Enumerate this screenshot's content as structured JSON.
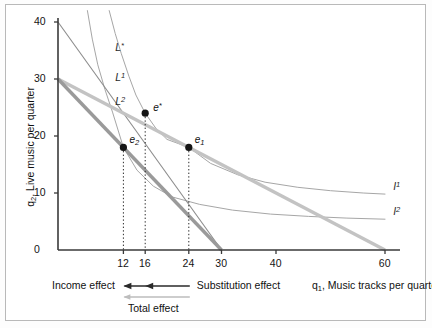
{
  "chart_data": {
    "type": "line",
    "title": "",
    "xlabel": "q₁, Music tracks per quarter",
    "ylabel": "q₂, Live music per quarter",
    "xlabel_main": "q",
    "xlabel_sub": "1",
    "xlabel_rest": ", Music tracks per quarter",
    "ylabel_main": "q",
    "ylabel_sub": "2",
    "ylabel_rest": ", Live music per quarter",
    "xlim": [
      0,
      64
    ],
    "ylim": [
      0,
      42
    ],
    "xticks": [
      12,
      16,
      24,
      30,
      40,
      60
    ],
    "xtick_labels": [
      "12",
      "16",
      "24",
      "30",
      "40",
      "60"
    ],
    "yticks": [
      0,
      10,
      20,
      30,
      40
    ],
    "ytick_labels": [
      "0",
      "10",
      "20",
      "30",
      "40"
    ],
    "grid": false,
    "legend_position": "inline-curve-labels",
    "budget_lines": [
      {
        "name": "L*",
        "label_main": "L",
        "label_sup": "*",
        "y_intercept": 40,
        "x_intercept": 30,
        "color": "#8c8c8c",
        "width": 1.1,
        "label_x": 10.5,
        "label_y": 35.5
      },
      {
        "name": "L1",
        "label_main": "L",
        "label_sup": "1",
        "y_intercept": 30,
        "x_intercept": 60,
        "color": "#c3c3c3",
        "width": 3.4,
        "label_x": 10.5,
        "label_y": 30.2
      },
      {
        "name": "L2",
        "label_main": "L",
        "label_sup": "2",
        "y_intercept": 30,
        "x_intercept": 30,
        "color": "#9a9a9a",
        "width": 3.4,
        "label_x": 10.5,
        "label_y": 26.0
      }
    ],
    "indifference_curves": [
      {
        "name": "I1",
        "label_main": "I",
        "label_sup": "1",
        "color": "#a6a6a6",
        "width": 1.0,
        "label_x": 61.5,
        "label_y": 11.0,
        "points": [
          [
            9.4,
            42
          ],
          [
            10.5,
            38
          ],
          [
            11.6,
            34.5
          ],
          [
            13.0,
            30.5
          ],
          [
            14.3,
            27.2
          ],
          [
            16.0,
            24.0
          ],
          [
            18.0,
            21.3
          ],
          [
            20.0,
            19.4
          ],
          [
            24.0,
            18.0
          ],
          [
            28.0,
            15.2
          ],
          [
            33.0,
            13.2
          ],
          [
            38.0,
            11.9
          ],
          [
            44.0,
            11.0
          ],
          [
            50.0,
            10.4
          ],
          [
            56.0,
            10.0
          ],
          [
            60.0,
            9.8
          ]
        ]
      },
      {
        "name": "I2",
        "label_main": "I",
        "label_sup": "2",
        "color": "#a6a6a6",
        "width": 1.0,
        "label_x": 61.5,
        "label_y": 6.6,
        "points": [
          [
            5.4,
            42
          ],
          [
            6.3,
            37
          ],
          [
            7.3,
            32.5
          ],
          [
            8.6,
            28.2
          ],
          [
            10.0,
            24.2
          ],
          [
            12.0,
            18.0
          ],
          [
            14.5,
            14.0
          ],
          [
            17.5,
            11.2
          ],
          [
            21.0,
            9.3
          ],
          [
            26.0,
            8.0
          ],
          [
            32.0,
            7.0
          ],
          [
            39.0,
            6.3
          ],
          [
            46.0,
            5.9
          ],
          [
            53.0,
            5.6
          ],
          [
            60.0,
            5.4
          ]
        ]
      }
    ],
    "equilibria": [
      {
        "name": "e*",
        "label_main": "e",
        "label_sup": "*",
        "x": 16,
        "y": 24,
        "label_dx": 8,
        "label_dy": -11
      },
      {
        "name": "e1",
        "label_main": "e",
        "label_sub": "1",
        "x": 24,
        "y": 18,
        "label_dx": 6,
        "label_dy": -12
      },
      {
        "name": "e2",
        "label_main": "e",
        "label_sub": "2",
        "x": 12,
        "y": 18,
        "label_dx": 6,
        "label_dy": -12
      }
    ],
    "dropline_xs": [
      12,
      16,
      24
    ],
    "annotations": {
      "income_effect": "Income effect",
      "substitution_effect": "Substitution effect",
      "total_effect": "Total effect"
    }
  },
  "axes": {
    "y_axis_title_main": "q",
    "y_axis_title_sub": "2",
    "y_axis_title_rest": ", Live music per quarter",
    "x_axis_title_main": "q",
    "x_axis_title_sub": "1",
    "x_axis_title_rest": ", Music tracks per quarter"
  },
  "colors": {
    "axis": "#3a3a3a",
    "frame": "#b9b9b9",
    "background": "#ffffff",
    "curve": "#a6a6a6",
    "budget_l1": "#c3c3c3",
    "budget_l2": "#9a9a9a",
    "budget_lstar": "#8c8c8c",
    "point": "#151515",
    "arrow_dark": "#2a2a2a",
    "arrow_light": "#bdbdbd"
  }
}
